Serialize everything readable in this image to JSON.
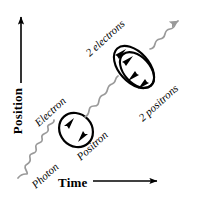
{
  "diagram": {
    "background_color": "#ffffff",
    "axes": {
      "y": {
        "label": "Position",
        "arrow_direction": "up",
        "color": "#000000"
      },
      "x": {
        "label": "Time",
        "arrow_direction": "right",
        "color": "#000000"
      }
    },
    "particles": {
      "photon_color": "#9a9a9a",
      "fermion_color": "#000000",
      "labels": {
        "electron": "Electron",
        "positron": "Positron",
        "photon": "Photon",
        "two_electrons": "2 electrons",
        "two_positrons": "2 positrons"
      }
    },
    "elements": {
      "incoming_photon": "photon-wave-icon",
      "first_loop": "electron-positron-loop-icon",
      "middle_photon": "photon-wave-icon",
      "second_loop": "double-pair-loop-icon",
      "outgoing_photon": "photon-wave-arrow-icon"
    }
  }
}
